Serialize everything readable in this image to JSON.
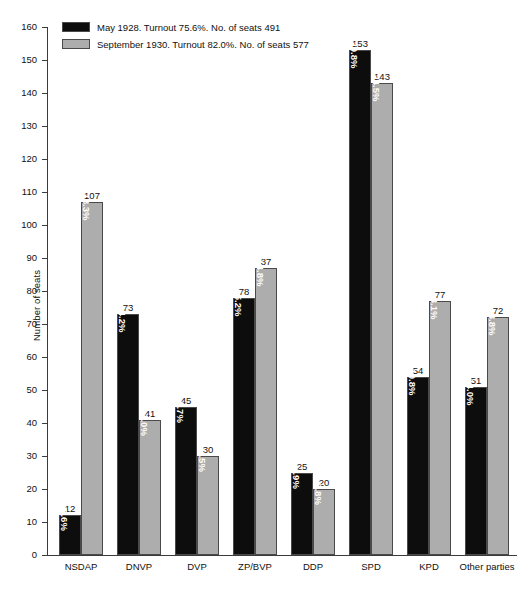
{
  "chart_data": {
    "type": "bar",
    "title": "",
    "xlabel": "",
    "ylabel": "Number of seats",
    "ylim": [
      0,
      160
    ],
    "ytick_step": 10,
    "yticks": [
      0,
      10,
      20,
      30,
      40,
      50,
      60,
      70,
      80,
      90,
      100,
      110,
      120,
      130,
      140,
      150,
      160
    ],
    "grid": false,
    "legend_position": "top-left",
    "categories": [
      "NSDAP",
      "DNVP",
      "DVP",
      "ZP/BVP",
      "DDP",
      "SPD",
      "KPD",
      "Other parties"
    ],
    "series": [
      {
        "name": "May 1928. Turnout 75.6%. No. of seats 491",
        "color": "#0d0d0d",
        "values": [
          12,
          73,
          45,
          78,
          25,
          153,
          54,
          51
        ],
        "percent_labels": [
          "2.6%",
          "14.2%",
          "8.7%",
          "15.2%",
          "4.9%",
          "29.8%",
          "10.8%",
          "14.0%"
        ]
      },
      {
        "name": "September 1930. Turnout 82.0%. No. of seats 577",
        "color": "#adadad",
        "values": [
          107,
          41,
          30,
          87,
          20,
          143,
          77,
          72
        ],
        "percent_labels": [
          "18.3%",
          "7.0%",
          "4.5%",
          "14.8%",
          "3.8%",
          "24.5%",
          "13.1%",
          "13.8%"
        ]
      }
    ]
  },
  "legend": {
    "items": [
      {
        "label": "May 1928. Turnout 75.6%. No. of seats 491"
      },
      {
        "label": "September 1930. Turnout 82.0%. No. of seats 577"
      }
    ]
  },
  "axis": {
    "y_title": "Number of seats"
  }
}
